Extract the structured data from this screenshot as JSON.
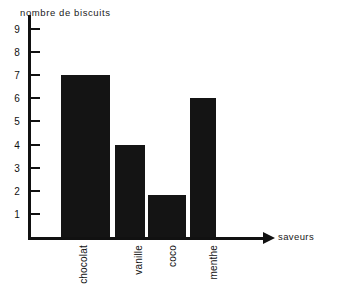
{
  "chart_data": {
    "type": "bar",
    "title": "",
    "xlabel": "saveurs",
    "ylabel": "nombre de biscuits",
    "categories": [
      "chocolat",
      "vanille",
      "coco",
      "menthe"
    ],
    "values": [
      7,
      4,
      1.8,
      6
    ],
    "ylim": [
      0,
      9.6
    ],
    "yticks": [
      1,
      2,
      3,
      4,
      5,
      6,
      7,
      8,
      9
    ],
    "ytick_labels": [
      "1",
      "2",
      "3",
      "4",
      "5",
      "6",
      "7",
      "8",
      "9"
    ],
    "grid": false,
    "legend": null,
    "bar_color": "#141414",
    "axis_color": "#111111",
    "background": "#ffffff",
    "x_axis_has_arrow": true,
    "category_label_rotation": -90
  },
  "axes": {
    "y_title": "nombre de biscuits",
    "x_title": "saveurs"
  },
  "colors": {
    "ink": "#111111",
    "bar": "#141414",
    "paper": "#ffffff"
  }
}
